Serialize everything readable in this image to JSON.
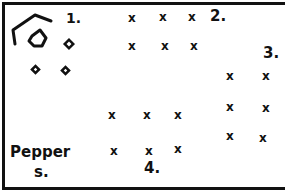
{
  "diagram": {
    "type": "garden-plot-plan",
    "stroke_color": "#111111",
    "background": "#ffffff",
    "sections": [
      {
        "label": "1.",
        "contents": "shapes: open pentagon outline, small pentagon, four small diamonds"
      },
      {
        "label": "2.",
        "marks": "x",
        "rows": 2,
        "cols": 3
      },
      {
        "label": "3.",
        "marks": "x",
        "rows": 3,
        "cols": 2
      },
      {
        "label": "4.",
        "marks": "x",
        "rows": 2,
        "cols": 3
      }
    ],
    "plant_label_line1": "Pepper",
    "plant_label_line2": "s.",
    "label_1": "1.",
    "label_2": "2.",
    "label_3": "3.",
    "label_4": "4.",
    "mark": "x"
  }
}
